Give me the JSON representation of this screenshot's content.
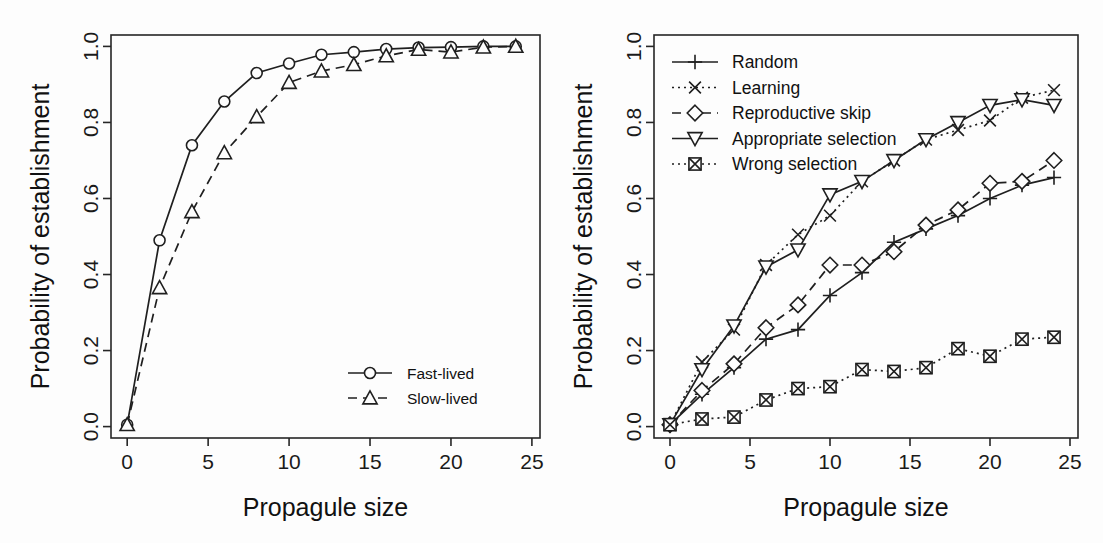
{
  "figure": {
    "background": "#fdfdfd",
    "foreground": "#1f1f1f",
    "width": 1103,
    "height": 543,
    "panels": 2
  },
  "chart_data": [
    {
      "panel": "left",
      "type": "line",
      "title": "",
      "xlabel": "Propagule size",
      "ylabel": "Probability of establishment",
      "xlim": [
        -1,
        25.5
      ],
      "ylim": [
        -0.03,
        1.03
      ],
      "xticks": [
        0,
        5,
        10,
        15,
        20,
        25
      ],
      "xticklabels": [
        "0",
        "5",
        "10",
        "15",
        "20",
        "25"
      ],
      "yticks": [
        0.0,
        0.2,
        0.4,
        0.6,
        0.8,
        1.0
      ],
      "yticklabels": [
        "0.0",
        "0.2",
        "0.4",
        "0.6",
        "0.8",
        "1.0"
      ],
      "grid": false,
      "legend_position": "bottom-right",
      "x": [
        0,
        2,
        4,
        6,
        8,
        10,
        12,
        14,
        16,
        18,
        20,
        22,
        24
      ],
      "series": [
        {
          "name": "Fast-lived",
          "marker": "circle",
          "linestyle": "solid",
          "values": [
            0.005,
            0.49,
            0.74,
            0.855,
            0.93,
            0.955,
            0.978,
            0.985,
            0.993,
            0.997,
            0.998,
            1.0,
            1.0
          ]
        },
        {
          "name": "Slow-lived",
          "marker": "triangle-up",
          "linestyle": "dashed",
          "values": [
            0.005,
            0.365,
            0.565,
            0.72,
            0.815,
            0.905,
            0.935,
            0.952,
            0.975,
            0.992,
            0.985,
            0.998,
            1.0
          ]
        }
      ]
    },
    {
      "panel": "right",
      "type": "line",
      "title": "",
      "xlabel": "Propagule size",
      "ylabel": "Probability of establishment",
      "xlim": [
        -1,
        25.5
      ],
      "ylim": [
        -0.03,
        1.03
      ],
      "xticks": [
        0,
        5,
        10,
        15,
        20,
        25
      ],
      "xticklabels": [
        "0",
        "5",
        "10",
        "15",
        "20",
        "25"
      ],
      "yticks": [
        0.0,
        0.2,
        0.4,
        0.6,
        0.8,
        1.0
      ],
      "yticklabels": [
        "0.0",
        "0.2",
        "0.4",
        "0.6",
        "0.8",
        "1.0"
      ],
      "grid": false,
      "legend_position": "top-left",
      "x": [
        0,
        2,
        4,
        6,
        8,
        10,
        12,
        14,
        16,
        18,
        20,
        22,
        24
      ],
      "series": [
        {
          "name": "Random",
          "marker": "plus",
          "linestyle": "solid",
          "values": [
            0.005,
            0.085,
            0.155,
            0.23,
            0.255,
            0.345,
            0.405,
            0.485,
            0.52,
            0.555,
            0.6,
            0.635,
            0.655
          ]
        },
        {
          "name": "Learning",
          "marker": "cross",
          "linestyle": "dotted",
          "values": [
            0.005,
            0.17,
            0.255,
            0.425,
            0.505,
            0.555,
            0.645,
            0.7,
            0.755,
            0.78,
            0.805,
            0.865,
            0.885
          ]
        },
        {
          "name": "Reproductive skip",
          "marker": "diamond",
          "linestyle": "dashed",
          "values": [
            0.005,
            0.095,
            0.165,
            0.26,
            0.32,
            0.425,
            0.425,
            0.46,
            0.53,
            0.57,
            0.64,
            0.645,
            0.7
          ]
        },
        {
          "name": "Appropriate selection",
          "marker": "triangle-down",
          "linestyle": "solid",
          "values": [
            0.005,
            0.15,
            0.265,
            0.42,
            0.465,
            0.61,
            0.645,
            0.7,
            0.755,
            0.8,
            0.845,
            0.86,
            0.845
          ]
        },
        {
          "name": "Wrong selection",
          "marker": "square-cross",
          "linestyle": "dotted",
          "values": [
            0.005,
            0.02,
            0.025,
            0.07,
            0.1,
            0.105,
            0.15,
            0.145,
            0.155,
            0.205,
            0.185,
            0.23,
            0.235
          ]
        }
      ]
    }
  ]
}
